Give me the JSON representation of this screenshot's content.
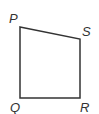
{
  "diagram": {
    "type": "quadrilateral",
    "stroke_color": "#333333",
    "vertices": [
      {
        "label": "P",
        "x": 20,
        "y": 27
      },
      {
        "label": "S",
        "x": 80,
        "y": 39
      },
      {
        "label": "R",
        "x": 80,
        "y": 98
      },
      {
        "label": "Q",
        "x": 20,
        "y": 98
      }
    ],
    "labels": {
      "P": "P",
      "S": "S",
      "R": "R",
      "Q": "Q"
    }
  }
}
